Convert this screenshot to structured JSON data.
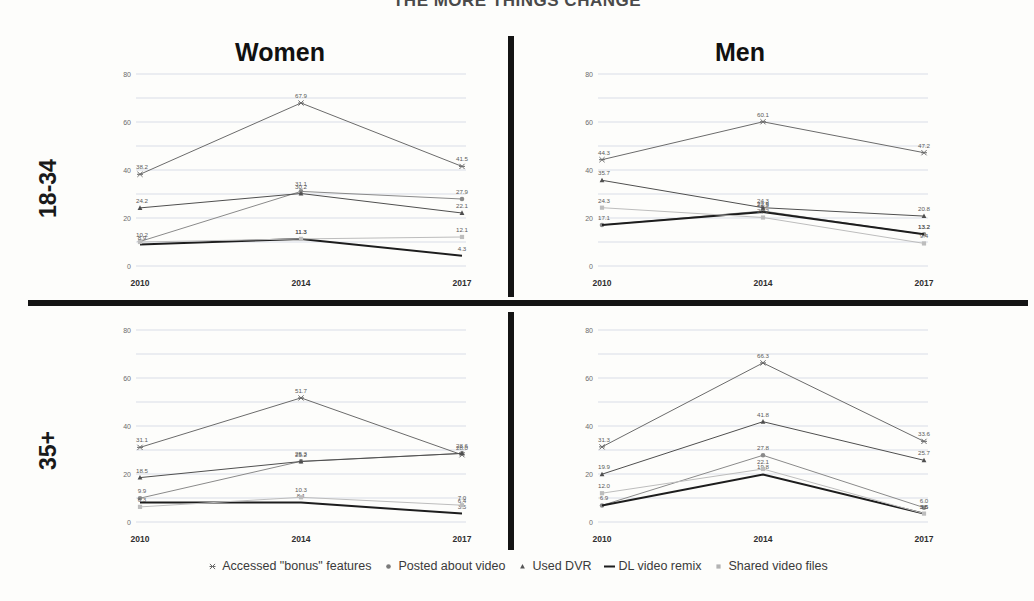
{
  "title": "THE MORE THINGS CHANGE",
  "row_labels": {
    "young": "18-34",
    "older": "35+"
  },
  "col_titles": {
    "women": "Women",
    "men": "Men"
  },
  "legend": {
    "items": [
      {
        "label": "Accessed \"bonus\" features",
        "marker": "star-x-marker",
        "color": "#6b6b6b"
      },
      {
        "label": "Posted about video",
        "marker": "circle-marker",
        "color": "#7a7a7a"
      },
      {
        "label": "Used DVR",
        "marker": "triangle-marker",
        "color": "#555555"
      },
      {
        "label": "DL video remix",
        "marker": "line-marker",
        "color": "#1d1d1d"
      },
      {
        "label": "Shared video files",
        "marker": "square-marker",
        "color": "#b3b3b3"
      }
    ]
  },
  "axis": {
    "y_ticks": [
      0,
      20,
      40,
      60,
      80
    ],
    "y_tick_labels": [
      "0",
      "20",
      "40",
      "60",
      "80"
    ],
    "ylim": [
      0,
      80
    ],
    "x_ticks": [
      "2010",
      "2014",
      "2017"
    ],
    "gridlines": [
      10,
      20,
      30,
      40,
      50,
      60,
      70,
      80
    ]
  },
  "chart_data": [
    {
      "type": "line",
      "id": "women-18-34",
      "title": "Women",
      "group": "18-34",
      "x": [
        "2010",
        "2014",
        "2017"
      ],
      "xlabel": "",
      "ylabel": "",
      "ylim": [
        0,
        80
      ],
      "grid": true,
      "legend_position": "bottom-shared",
      "series": [
        {
          "name": "Accessed \"bonus\" features",
          "values": [
            38.2,
            67.9,
            41.5
          ],
          "labels": [
            "38.2",
            "67.9",
            "41.5"
          ],
          "color": "#6b6b6b",
          "marker": "star-x-marker"
        },
        {
          "name": "Posted about video",
          "values": [
            10.2,
            31.1,
            27.9
          ],
          "labels": [
            "10.2",
            "31.1",
            "27.9"
          ],
          "color": "#8a8a8a",
          "marker": "circle-marker"
        },
        {
          "name": "Used DVR",
          "values": [
            24.2,
            30.2,
            22.1
          ],
          "labels": [
            "24.2",
            "30.2",
            "22.1"
          ],
          "color": "#4f4f4f",
          "marker": "triangle-marker"
        },
        {
          "name": "DL video remix",
          "values": [
            8.9,
            11.3,
            4.3
          ],
          "labels": [
            "8.9",
            "11.3",
            "4.3"
          ],
          "color": "#1d1d1d",
          "marker": "line-marker"
        },
        {
          "name": "Shared video files",
          "values": [
            10.0,
            11.3,
            12.1
          ],
          "labels": [
            "",
            "11.3",
            "12.1"
          ],
          "color": "#bdbdbd",
          "marker": "square-marker"
        }
      ]
    },
    {
      "type": "line",
      "id": "men-18-34",
      "title": "Men",
      "group": "18-34",
      "x": [
        "2010",
        "2014",
        "2017"
      ],
      "xlabel": "",
      "ylabel": "",
      "ylim": [
        0,
        80
      ],
      "grid": true,
      "legend_position": "bottom-shared",
      "series": [
        {
          "name": "Accessed \"bonus\" features",
          "values": [
            44.3,
            60.1,
            47.2
          ],
          "labels": [
            "44.3",
            "60.1",
            "47.2"
          ],
          "color": "#6b6b6b",
          "marker": "star-x-marker"
        },
        {
          "name": "Posted about video",
          "values": [
            17.1,
            22.9,
            13.2
          ],
          "labels": [
            "17.1",
            "22.9",
            "13.2"
          ],
          "color": "#8a8a8a",
          "marker": "circle-marker"
        },
        {
          "name": "Used DVR",
          "values": [
            35.7,
            24.3,
            20.8
          ],
          "labels": [
            "35.7",
            "24.3",
            "20.8"
          ],
          "color": "#4f4f4f",
          "marker": "triangle-marker"
        },
        {
          "name": "DL video remix",
          "values": [
            17.1,
            22.5,
            13.2
          ],
          "labels": [
            "",
            "22.5",
            "13.2"
          ],
          "color": "#1d1d1d",
          "marker": "line-marker"
        },
        {
          "name": "Shared video files",
          "values": [
            24.3,
            20.2,
            9.4
          ],
          "labels": [
            "24.3",
            "20.2",
            "9.4"
          ],
          "color": "#bdbdbd",
          "marker": "square-marker"
        }
      ]
    },
    {
      "type": "line",
      "id": "women-35-plus",
      "title": "Women",
      "group": "35+",
      "x": [
        "2010",
        "2014",
        "2017"
      ],
      "xlabel": "",
      "ylabel": "",
      "ylim": [
        0,
        80
      ],
      "grid": true,
      "legend_position": "bottom-shared",
      "series": [
        {
          "name": "Accessed \"bonus\" features",
          "values": [
            31.1,
            51.7,
            28.0
          ],
          "labels": [
            "31.1",
            "51.7",
            "28.0"
          ],
          "color": "#6b6b6b",
          "marker": "star-x-marker"
        },
        {
          "name": "Posted about video",
          "values": [
            9.9,
            25.3,
            28.6
          ],
          "labels": [
            "9.9",
            "25.3",
            "28.6"
          ],
          "color": "#8a8a8a",
          "marker": "circle-marker"
        },
        {
          "name": "Used DVR",
          "values": [
            18.5,
            25.2,
            28.6
          ],
          "labels": [
            "18.5",
            "25.2",
            ""
          ],
          "color": "#4f4f4f",
          "marker": "triangle-marker"
        },
        {
          "name": "DL video remix",
          "values": [
            8.1,
            8.1,
            3.5
          ],
          "labels": [
            "",
            "8.1",
            "3.5"
          ],
          "color": "#1d1d1d",
          "marker": "line-marker"
        },
        {
          "name": "Shared video files",
          "values": [
            6.3,
            10.3,
            7.0
          ],
          "labels": [
            "6.3",
            "10.3",
            "7.0"
          ],
          "color": "#bdbdbd",
          "marker": "square-marker"
        }
      ],
      "extra_labels": [
        {
          "text": "6.4",
          "x": "2017",
          "value": 6.4
        }
      ]
    },
    {
      "type": "line",
      "id": "men-35-plus",
      "title": "Men",
      "group": "35+",
      "x": [
        "2010",
        "2014",
        "2017"
      ],
      "xlabel": "",
      "ylabel": "",
      "ylim": [
        0,
        80
      ],
      "grid": true,
      "legend_position": "bottom-shared",
      "series": [
        {
          "name": "Accessed \"bonus\" features",
          "values": [
            31.3,
            66.3,
            33.6
          ],
          "labels": [
            "31.3",
            "66.3",
            "33.6"
          ],
          "color": "#6b6b6b",
          "marker": "star-x-marker"
        },
        {
          "name": "Posted about video",
          "values": [
            6.9,
            27.8,
            6.0
          ],
          "labels": [
            "6.9",
            "27.8",
            "6.0"
          ],
          "color": "#8a8a8a",
          "marker": "circle-marker"
        },
        {
          "name": "Used DVR",
          "values": [
            19.9,
            41.8,
            25.7
          ],
          "labels": [
            "19.9",
            "41.8",
            "25.7"
          ],
          "color": "#4f4f4f",
          "marker": "triangle-marker"
        },
        {
          "name": "DL video remix",
          "values": [
            6.9,
            19.8,
            3.5
          ],
          "labels": [
            "",
            "19.8",
            "3.5"
          ],
          "color": "#1d1d1d",
          "marker": "line-marker"
        },
        {
          "name": "Shared video files",
          "values": [
            12.0,
            22.1,
            3.5
          ],
          "labels": [
            "12.0",
            "22.1",
            "3.5"
          ],
          "color": "#bdbdbd",
          "marker": "square-marker"
        }
      ]
    }
  ]
}
